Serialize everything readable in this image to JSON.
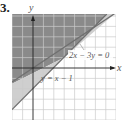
{
  "problem_number": "3.",
  "axes": {
    "x_label": "x",
    "y_label": "y"
  },
  "equations": [
    {
      "label": "2x − 3y = 0",
      "slope": 0.6667,
      "intercept": 0
    },
    {
      "label": "y = x − 1",
      "slope": 1,
      "intercept": -1
    }
  ],
  "grid": {
    "x_min": -2,
    "x_max": 8,
    "y_min": -5,
    "y_max": 5,
    "step": 1
  },
  "colors": {
    "dark_shade": "#8a8a8a",
    "light_shade": "#cfcfcf",
    "line": "#6f6f6f",
    "grid": "#cccccc",
    "axis": "#222222"
  }
}
